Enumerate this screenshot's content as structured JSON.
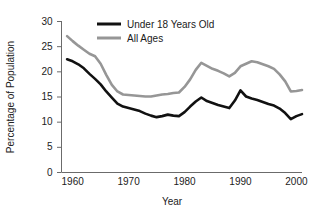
{
  "chart_data": {
    "type": "line",
    "title": "",
    "subtitle": "",
    "xlabel": "Year",
    "ylabel": "Percentage of Population",
    "xlim": [
      1958,
      2001
    ],
    "ylim": [
      0,
      30
    ],
    "xticks": [
      1960,
      1970,
      1980,
      1990,
      2000
    ],
    "xtick_labels": [
      "1960",
      "1970",
      "1980",
      "1990",
      "2000"
    ],
    "yticks": [
      0,
      5,
      10,
      15,
      20,
      25,
      30
    ],
    "ytick_labels": [
      "0",
      "5",
      "10",
      "15",
      "20",
      "25",
      "30"
    ],
    "grid": false,
    "legend_position": "top-center",
    "x": [
      1959,
      1960,
      1961,
      1962,
      1963,
      1964,
      1965,
      1966,
      1967,
      1968,
      1969,
      1970,
      1971,
      1972,
      1973,
      1974,
      1975,
      1976,
      1977,
      1978,
      1979,
      1980,
      1981,
      1982,
      1983,
      1984,
      1985,
      1986,
      1987,
      1988,
      1989,
      1990,
      1991,
      1992,
      1993,
      1994,
      1995,
      1996,
      1997,
      1998,
      1999,
      2000,
      2001
    ],
    "series": [
      {
        "name": "Under 18 Years Old",
        "color": "#111111",
        "values": [
          22.4,
          22.0,
          21.4,
          20.6,
          19.5,
          18.5,
          17.4,
          16.0,
          14.8,
          13.6,
          13.0,
          12.7,
          12.4,
          12.1,
          11.6,
          11.2,
          10.9,
          11.1,
          11.4,
          11.2,
          11.1,
          11.9,
          13.0,
          14.0,
          14.8,
          14.1,
          13.7,
          13.3,
          13.0,
          12.7,
          14.2,
          16.2,
          15.0,
          14.6,
          14.3,
          13.9,
          13.5,
          13.2,
          12.6,
          11.7,
          10.5,
          11.1,
          11.5
        ]
      },
      {
        "name": "All Ages",
        "color": "#969696",
        "values": [
          27.0,
          26.0,
          25.1,
          24.3,
          23.5,
          23.0,
          21.5,
          19.3,
          17.3,
          16.0,
          15.4,
          15.3,
          15.2,
          15.1,
          15.0,
          15.0,
          15.2,
          15.4,
          15.5,
          15.7,
          15.8,
          16.9,
          18.4,
          20.3,
          21.7,
          21.1,
          20.5,
          20.1,
          19.6,
          19.0,
          19.7,
          21.0,
          21.5,
          22.0,
          21.8,
          21.4,
          21.0,
          20.5,
          19.4,
          18.0,
          16.0,
          16.1,
          16.3
        ]
      }
    ],
    "legend": [
      {
        "label": "Under 18 Years Old",
        "color": "#111111"
      },
      {
        "label": "All Ages",
        "color": "#969696"
      }
    ]
  },
  "axis": {
    "line_color": "#6b6b6b",
    "tick_color": "#6b6b6b"
  }
}
